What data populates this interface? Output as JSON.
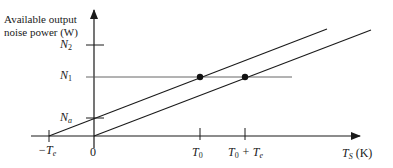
{
  "diagram": {
    "y_axis_label_line1": "Available output",
    "y_axis_label_line2": "noise power (W)",
    "x_axis_label_main": "T",
    "x_axis_label_sub": "S",
    "x_axis_label_unit": "(K)",
    "y_ticks": [
      {
        "main": "N",
        "sub": "2"
      },
      {
        "main": "N",
        "sub": "1"
      },
      {
        "main": "N",
        "sub": "a"
      }
    ],
    "x_ticks": [
      {
        "main": "−T",
        "sub": "e"
      },
      {
        "main": "0",
        "sub": ""
      },
      {
        "main": "T",
        "sub": "0"
      },
      {
        "main": "T",
        "sub": "0",
        "rest": " + T",
        "sub2": "e"
      }
    ],
    "lines": [
      {
        "name": "line-with-noise-offset",
        "description": "starts at -Te on x-axis, passes Na at 0"
      },
      {
        "name": "line-from-origin",
        "description": "starts at origin"
      }
    ],
    "points": [
      "intersection at T0, N1",
      "intersection at T0+Te, N1"
    ],
    "colors": {
      "stroke": "#1a1a1a",
      "n1_line": "#555555"
    }
  }
}
